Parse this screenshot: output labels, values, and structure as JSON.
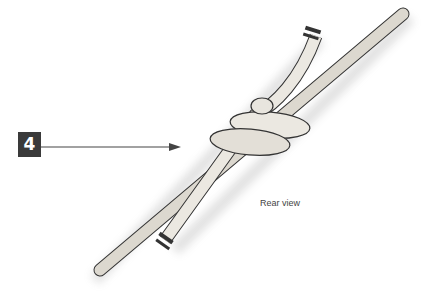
{
  "step": {
    "number": "4"
  },
  "caption": "Rear view",
  "illustration": {
    "subject": "knot-rear-view",
    "rope_color": "#e6e3dc",
    "outline_color": "#333333"
  }
}
